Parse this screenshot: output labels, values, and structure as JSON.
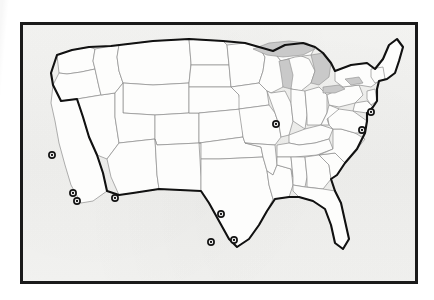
{
  "figure": {
    "kind": "map",
    "title": "",
    "region": "Contiguous United States",
    "caption": "",
    "frame": {
      "border_color": "#1a1a1a",
      "border_width_px": 3,
      "background_color": "#f2f2f0"
    }
  },
  "map": {
    "projection_note": "contiguous-48 outline with state boundaries",
    "land_fill": "#fdfdfc",
    "state_border_color": "#8d8d8d",
    "national_border_color": "#111111",
    "lake_fill": "#c9c9c9",
    "lakes": [
      {
        "name": "Lake Superior"
      },
      {
        "name": "Lake Michigan"
      },
      {
        "name": "Lake Huron"
      },
      {
        "name": "Lake Erie"
      },
      {
        "name": "Lake Ontario"
      }
    ]
  },
  "markers": {
    "style": "bullseye",
    "ring_color": "#141414",
    "dot_color": "#141414",
    "count": 10,
    "points": [
      {
        "label": "San Francisco Bay Area",
        "x": 52,
        "y": 155
      },
      {
        "label": "Los Angeles",
        "x": 73,
        "y": 193
      },
      {
        "label": "San Diego",
        "x": 77,
        "y": 201
      },
      {
        "label": "Phoenix",
        "x": 115,
        "y": 198
      },
      {
        "label": "Dallas",
        "x": 221,
        "y": 214
      },
      {
        "label": "San Antonio",
        "x": 211,
        "y": 242
      },
      {
        "label": "Houston",
        "x": 234,
        "y": 240
      },
      {
        "label": "Chicago",
        "x": 276,
        "y": 124
      },
      {
        "label": "New York City",
        "x": 371,
        "y": 112
      },
      {
        "label": "Washington D.C.",
        "x": 362,
        "y": 130
      }
    ]
  }
}
